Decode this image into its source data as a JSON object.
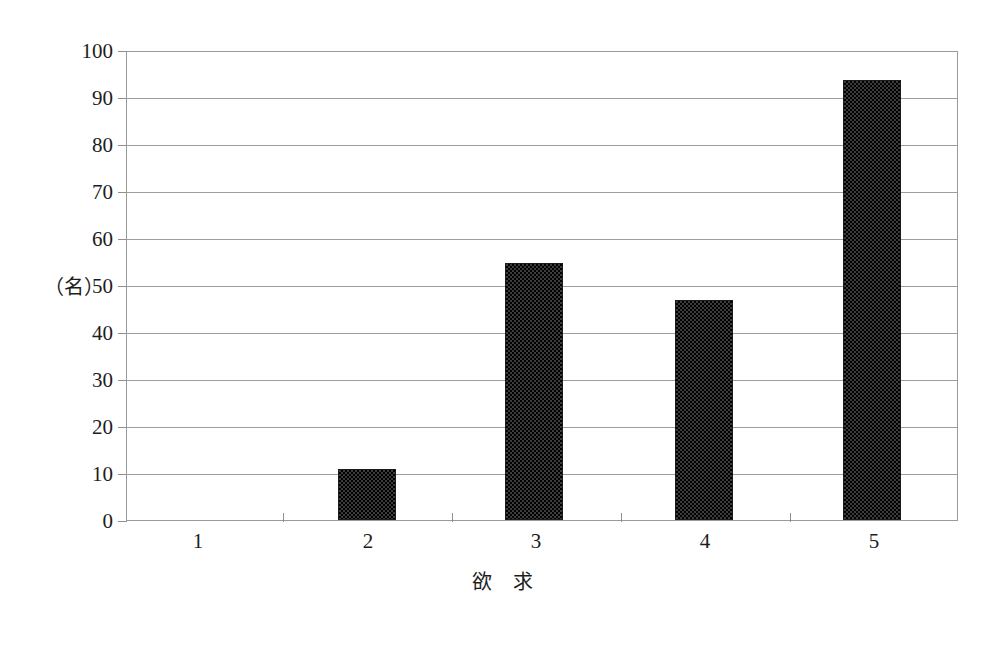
{
  "chart_data": {
    "type": "bar",
    "title": "",
    "subtitle": "",
    "xlabel": "欲　求",
    "ylabel": "（名）",
    "categories": [
      "1",
      "2",
      "3",
      "4",
      "5"
    ],
    "values": [
      0,
      11,
      55,
      47,
      94
    ],
    "ylim": [
      0,
      100
    ],
    "ytick_labels": [
      "0",
      "10",
      "20",
      "30",
      "40",
      "50",
      "60",
      "70",
      "80",
      "90",
      "100"
    ],
    "ytick_values": [
      0,
      10,
      20,
      30,
      40,
      50,
      60,
      70,
      80,
      90,
      100
    ],
    "grid": true,
    "legend": null,
    "legend_position": "none",
    "series": [
      {
        "name": "人数",
        "values": [
          0,
          11,
          55,
          47,
          94
        ]
      }
    ],
    "bar_color": "#3c3c3c",
    "bar_pattern": "dense-checker-dither",
    "gridline_color": "#9d9d9d",
    "frame_color": "#9a9a9a",
    "background_color": "#ffffff"
  },
  "axes": {
    "y_unit_label": "（名）",
    "x_title": "欲　求"
  }
}
